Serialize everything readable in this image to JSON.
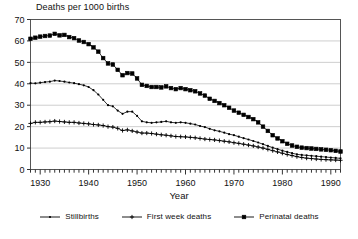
{
  "chart_data": {
    "type": "line",
    "title": "Deaths per 1000 births",
    "xlabel": "Year",
    "ylabel": "",
    "xlim": [
      1928,
      1992
    ],
    "ylim": [
      0,
      70
    ],
    "ytick_step": 10,
    "yticks": [
      0,
      10,
      20,
      30,
      40,
      50,
      60,
      70
    ],
    "xticks_labeled": [
      1930,
      1940,
      1950,
      1960,
      1970,
      1980,
      1990
    ],
    "xtick_minor_step": 1,
    "grid": "horizontal",
    "legend_position": "bottom",
    "x": [
      1928,
      1929,
      1930,
      1931,
      1932,
      1933,
      1934,
      1935,
      1936,
      1937,
      1938,
      1939,
      1940,
      1941,
      1942,
      1943,
      1944,
      1945,
      1946,
      1947,
      1948,
      1949,
      1950,
      1951,
      1952,
      1953,
      1954,
      1955,
      1956,
      1957,
      1958,
      1959,
      1960,
      1961,
      1962,
      1963,
      1964,
      1965,
      1966,
      1967,
      1968,
      1969,
      1970,
      1971,
      1972,
      1973,
      1974,
      1975,
      1976,
      1977,
      1978,
      1979,
      1980,
      1981,
      1982,
      1983,
      1984,
      1985,
      1986,
      1987,
      1988,
      1989,
      1990,
      1991,
      1992
    ],
    "series": [
      {
        "name": "Perinatal deaths",
        "marker": "square",
        "values": [
          61.0,
          61.5,
          62.0,
          62.3,
          62.5,
          63.3,
          62.6,
          62.8,
          61.8,
          61.3,
          60.2,
          59.5,
          58.5,
          57.0,
          55.0,
          52.0,
          49.5,
          49.0,
          46.5,
          44.0,
          45.0,
          44.8,
          42.5,
          39.5,
          39.0,
          38.5,
          38.5,
          38.3,
          38.8,
          38.0,
          37.5,
          38.0,
          37.5,
          37.0,
          36.5,
          35.5,
          34.5,
          33.0,
          32.0,
          31.0,
          30.0,
          28.8,
          27.5,
          26.5,
          25.5,
          24.5,
          23.5,
          22.0,
          20.0,
          18.0,
          16.0,
          14.5,
          13.2,
          12.0,
          11.2,
          10.6,
          10.2,
          10.0,
          9.8,
          9.6,
          9.4,
          9.2,
          9.0,
          8.7,
          8.4
        ]
      },
      {
        "name": "Stillbirths",
        "marker": "dot",
        "values": [
          40.3,
          40.2,
          40.5,
          40.8,
          41.0,
          41.5,
          41.3,
          41.0,
          40.6,
          40.3,
          39.8,
          39.3,
          38.5,
          37.0,
          35.0,
          32.5,
          30.0,
          29.5,
          27.5,
          26.0,
          27.0,
          27.0,
          25.0,
          22.5,
          22.0,
          21.8,
          22.0,
          22.2,
          22.5,
          22.0,
          21.8,
          22.0,
          21.8,
          21.4,
          21.0,
          20.3,
          19.8,
          19.0,
          18.3,
          17.8,
          17.2,
          16.5,
          16.0,
          15.3,
          14.6,
          14.0,
          13.3,
          12.6,
          11.8,
          11.0,
          10.2,
          9.5,
          8.8,
          8.2,
          7.6,
          7.1,
          6.8,
          6.6,
          6.4,
          6.2,
          6.0,
          5.8,
          5.6,
          5.4,
          5.2
        ]
      },
      {
        "name": "First week deaths",
        "marker": "plus",
        "values": [
          21.5,
          22.0,
          22.0,
          22.2,
          22.3,
          22.6,
          22.4,
          22.2,
          22.0,
          22.0,
          21.7,
          21.5,
          21.3,
          21.0,
          20.8,
          20.5,
          20.0,
          19.8,
          19.2,
          18.2,
          18.5,
          18.0,
          17.5,
          17.0,
          17.0,
          16.8,
          16.5,
          16.2,
          16.0,
          15.7,
          15.4,
          15.3,
          15.2,
          15.0,
          14.8,
          14.5,
          14.2,
          14.0,
          13.8,
          13.5,
          13.2,
          12.9,
          12.5,
          12.2,
          11.8,
          11.4,
          11.0,
          10.5,
          10.0,
          9.4,
          8.8,
          8.2,
          7.6,
          7.0,
          6.5,
          6.0,
          5.6,
          5.3,
          5.1,
          4.9,
          4.7,
          4.6,
          4.5,
          4.4,
          4.3
        ]
      }
    ],
    "legend": [
      {
        "label": "Stillbirths",
        "marker": "dot"
      },
      {
        "label": "First week deaths",
        "marker": "plus"
      },
      {
        "label": "Perinatal deaths",
        "marker": "square"
      }
    ]
  }
}
